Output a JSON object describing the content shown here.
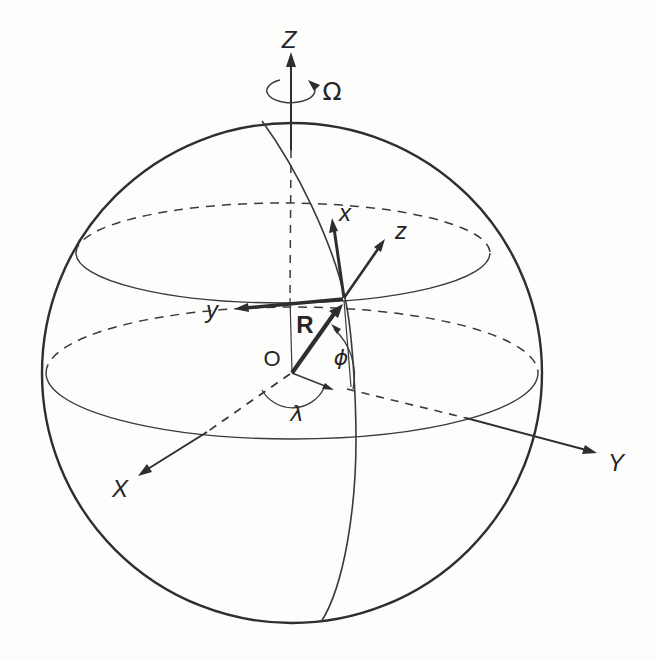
{
  "figure": {
    "background": "#fdfdfc",
    "ink": "#2e2e2e",
    "labels": {
      "rotation_axis": "Z",
      "angular_velocity": "Ω",
      "local_x": "x",
      "local_z": "z",
      "local_y": "y",
      "position_vector": "R",
      "origin": "O",
      "latitude": "ϕ",
      "longitude": "λ",
      "inertial_x": "X",
      "inertial_y": "Y"
    }
  }
}
